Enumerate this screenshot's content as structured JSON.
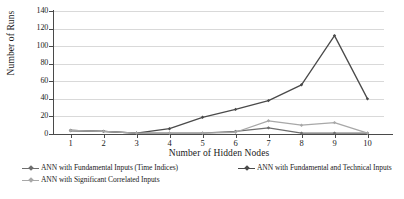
{
  "chart_data": {
    "type": "line",
    "title": "",
    "xlabel": "Number of Hidden Nodes",
    "ylabel": "Number of Runs",
    "x": [
      1,
      2,
      3,
      4,
      5,
      6,
      7,
      8,
      9,
      10
    ],
    "categories": [
      "1",
      "2",
      "3",
      "4",
      "5",
      "6",
      "7",
      "8",
      "9",
      "10"
    ],
    "xlim": [
      0.5,
      10.5
    ],
    "ylim": [
      0,
      140
    ],
    "yticks": [
      0,
      20,
      40,
      60,
      80,
      100,
      120,
      140
    ],
    "ytick_labels": [
      "0",
      "20",
      "40",
      "60",
      "80",
      "100",
      "120",
      "140"
    ],
    "grid": "horizontal",
    "legend_position": "bottom",
    "series": [
      {
        "name": "ANN with Fundamental Inputs (Time Indices)",
        "color": "#6e6e6e",
        "values": [
          4,
          3,
          1,
          1,
          1,
          3,
          7,
          1,
          1,
          1
        ]
      },
      {
        "name": "ANN with Fundamental and Technical Inputs",
        "color": "#4a4a4a",
        "values": [
          4,
          3,
          1,
          6,
          19,
          28,
          38,
          56,
          112,
          40
        ]
      },
      {
        "name": "ANN with Significant Correlated Inputs",
        "color": "#a8a8a8",
        "values": [
          4,
          3,
          1,
          1,
          1,
          2,
          15,
          10,
          13,
          1
        ]
      }
    ]
  },
  "axis": {
    "y_title": "Number of Runs",
    "x_title": "Number of Hidden Nodes"
  },
  "legend": {
    "items": [
      {
        "label": "ANN with Fundamental Inputs (Time Indices)"
      },
      {
        "label": "ANN with Fundamental and Technical Inputs"
      },
      {
        "label": "ANN with Significant Correlated Inputs"
      }
    ]
  },
  "colors": {
    "series1": "#6e6e6e",
    "series2": "#4a4a4a",
    "series3": "#a8a8a8",
    "grid": "#d9d9d9",
    "axis": "#4a4a4a",
    "background": "#ffffff"
  }
}
